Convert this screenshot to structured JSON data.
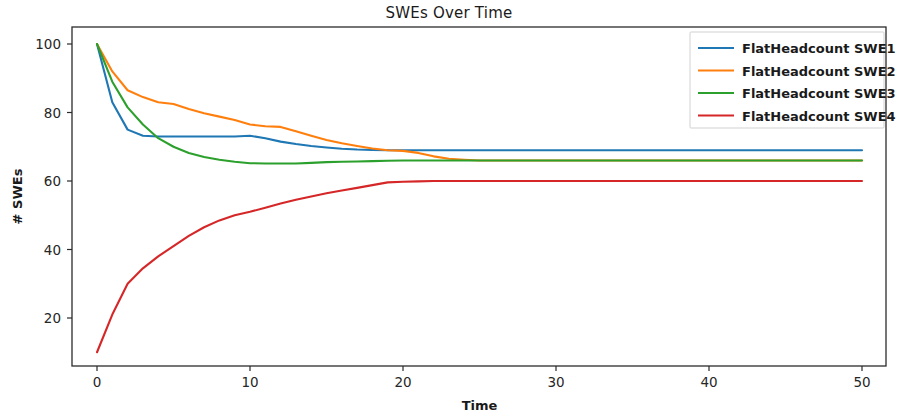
{
  "chart_data": {
    "type": "line",
    "title": "SWEs Over Time",
    "xlabel": "Time",
    "ylabel": "# SWEs",
    "xlim": [
      -1.8,
      52.0
    ],
    "ylim": [
      4.0,
      105.0
    ],
    "xticks": [
      0,
      10,
      20,
      30,
      40,
      50
    ],
    "xtick_labels": [
      "0",
      "10",
      "20",
      "30",
      "40",
      "50"
    ],
    "yticks": [
      20,
      40,
      60,
      80,
      100
    ],
    "ytick_labels": [
      "20",
      "40",
      "60",
      "80",
      "100"
    ],
    "grid": false,
    "legend_position": "upper right",
    "x": [
      0,
      1,
      2,
      3,
      4,
      5,
      6,
      7,
      8,
      9,
      10,
      11,
      12,
      13,
      14,
      15,
      16,
      17,
      18,
      19,
      20,
      21,
      22,
      23,
      24,
      25,
      26,
      27,
      28,
      29,
      30,
      31,
      32,
      33,
      34,
      35,
      36,
      37,
      38,
      39,
      40,
      41,
      42,
      43,
      44,
      45,
      46,
      47,
      48,
      49,
      50
    ],
    "series": [
      {
        "name": "FlatHeadcount SWE1",
        "color": "#1f77b4",
        "values": [
          100,
          83,
          75,
          73.2,
          73,
          73,
          73,
          73,
          73,
          73,
          73.2,
          72.5,
          71.5,
          70.8,
          70.2,
          69.8,
          69.4,
          69.2,
          69.1,
          69,
          69,
          69,
          69,
          69,
          69,
          69,
          69,
          69,
          69,
          69,
          69,
          69,
          69,
          69,
          69,
          69,
          69,
          69,
          69,
          69,
          69,
          69,
          69,
          69,
          69,
          69,
          69,
          69,
          69,
          69,
          69
        ]
      },
      {
        "name": "FlatHeadcount SWE2",
        "color": "#ff7f0e",
        "values": [
          100,
          92,
          86.5,
          84.5,
          83,
          82.5,
          81,
          79.8,
          78.8,
          77.8,
          76.5,
          76,
          75.8,
          74.5,
          73.2,
          72,
          71,
          70.2,
          69.5,
          69,
          68.8,
          68.2,
          67.2,
          66.5,
          66.2,
          66,
          66,
          66,
          66,
          66,
          66,
          66,
          66,
          66,
          66,
          66,
          66,
          66,
          66,
          66,
          66,
          66,
          66,
          66,
          66,
          66,
          66,
          66,
          66,
          66,
          66
        ]
      },
      {
        "name": "FlatHeadcount SWE3",
        "color": "#2ca02c",
        "values": [
          100,
          89,
          81.5,
          76.5,
          72.5,
          70,
          68.2,
          67,
          66.2,
          65.6,
          65.2,
          65.1,
          65.1,
          65.1,
          65.3,
          65.5,
          65.6,
          65.7,
          65.8,
          65.9,
          66,
          66,
          66,
          66,
          66,
          66,
          66,
          66,
          66,
          66,
          66,
          66,
          66,
          66,
          66,
          66,
          66,
          66,
          66,
          66,
          66,
          66,
          66,
          66,
          66,
          66,
          66,
          66,
          66,
          66,
          66
        ]
      },
      {
        "name": "FlatHeadcount SWE4",
        "color": "#d62728",
        "values": [
          10,
          21,
          30,
          34.5,
          38,
          41,
          44,
          46.5,
          48.5,
          50,
          51,
          52.2,
          53.4,
          54.5,
          55.5,
          56.4,
          57.2,
          58,
          58.8,
          59.6,
          59.8,
          59.9,
          60,
          60,
          60,
          60,
          60,
          60,
          60,
          60,
          60,
          60,
          60,
          60,
          60,
          60,
          60,
          60,
          60,
          60,
          60,
          60,
          60,
          60,
          60,
          60,
          60,
          60,
          60,
          60,
          60
        ]
      }
    ]
  },
  "legend": {
    "entries": [
      "FlatHeadcount SWE1",
      "FlatHeadcount SWE2",
      "FlatHeadcount SWE3",
      "FlatHeadcount SWE4"
    ]
  }
}
